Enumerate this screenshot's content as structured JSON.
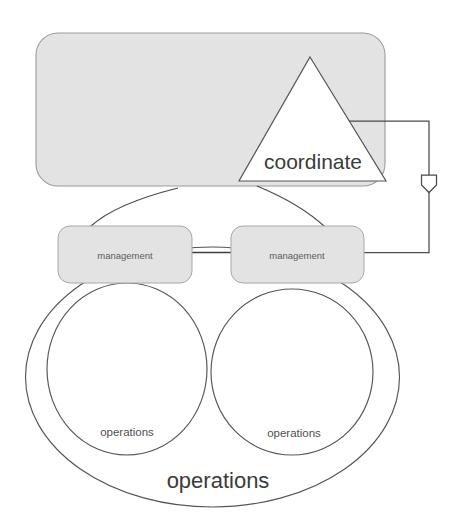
{
  "diagram": {
    "background_color": "#ffffff",
    "stroke_color": "#555555",
    "box_fill_color": "#e2e2e2",
    "box_stroke_color": "#9a9a9a",
    "text_color": "#4a4a4a",
    "nodes": {
      "coordinate_container": {
        "shape": "rounded-rectangle",
        "label": "",
        "fill": "#e2e2e2"
      },
      "coordinate_triangle": {
        "shape": "triangle",
        "label": "coordinate",
        "fill": "#ffffff"
      },
      "management_left": {
        "shape": "rounded-rectangle",
        "label": "management",
        "fill": "#e2e2e2"
      },
      "management_right": {
        "shape": "rounded-rectangle",
        "label": "management",
        "fill": "#e2e2e2"
      },
      "operations_left": {
        "shape": "circle",
        "label": "operations",
        "fill": "#ffffff"
      },
      "operations_right": {
        "shape": "circle",
        "label": "operations",
        "fill": "#ffffff"
      },
      "operations_outer": {
        "shape": "circle",
        "label": "operations",
        "fill": "none"
      }
    },
    "connectors": {
      "coordinate_to_management_left": "curve",
      "coordinate_to_management_right": "curve",
      "management_left_to_management_right": "line",
      "management_right_feedback_to_coordinate": "orthogonal-with-arrowhead",
      "arrowhead_style": "hollow-pentagon-down"
    }
  }
}
